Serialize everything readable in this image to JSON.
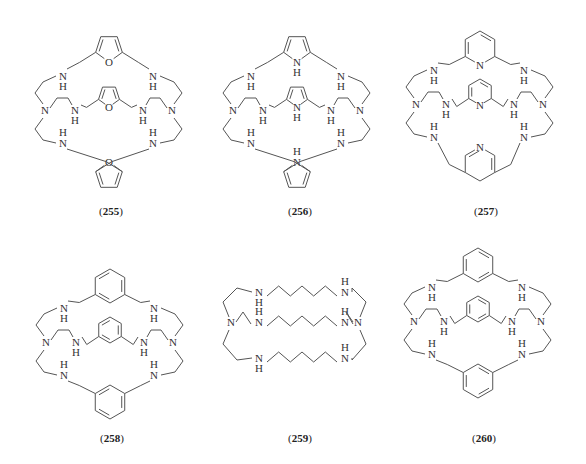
{
  "figure": {
    "compounds": [
      {
        "id": "255",
        "label_open": "(",
        "number": "255",
        "label_close": ")",
        "linker": "furan",
        "heteroatom": "O",
        "arm_atoms": "NH",
        "cx": 109,
        "top": 26,
        "label_x": 111,
        "label_y": 213
      },
      {
        "id": "256",
        "label_open": "(",
        "number": "256",
        "label_close": ")",
        "linker": "pyrrole",
        "heteroatom": "N",
        "heteroatom_h": "H",
        "arm_atoms": "NH",
        "cx": 297,
        "top": 26,
        "label_x": 300,
        "label_y": 213
      },
      {
        "id": "257",
        "label_open": "(",
        "number": "257",
        "label_close": ")",
        "linker": "pyridine",
        "heteroatom": "N",
        "arm_atoms": "NH",
        "cx": 480,
        "top": 20,
        "label_x": 486,
        "label_y": 213
      },
      {
        "id": "258",
        "label_open": "(",
        "number": "258",
        "label_close": ")",
        "linker": "para-xylyl",
        "arm_atoms": "NH",
        "cx": 110,
        "top": 258,
        "label_x": 112,
        "label_y": 440
      },
      {
        "id": "259",
        "label_open": "(",
        "number": "259",
        "label_close": ")",
        "linker": "butylene",
        "arm_atoms": "NH",
        "cx": 295,
        "top": 270,
        "label_x": 300,
        "label_y": 440
      },
      {
        "id": "260",
        "label_open": "(",
        "number": "260",
        "label_close": ")",
        "linker": "meta-xylyl",
        "arm_atoms": "NH",
        "cx": 478,
        "top": 237,
        "label_x": 484,
        "label_y": 440
      }
    ],
    "atoms": {
      "N": "N",
      "H": "H",
      "O": "O"
    },
    "colors": {
      "bond": "#555555",
      "text": "#333333",
      "label": "#222222"
    }
  }
}
